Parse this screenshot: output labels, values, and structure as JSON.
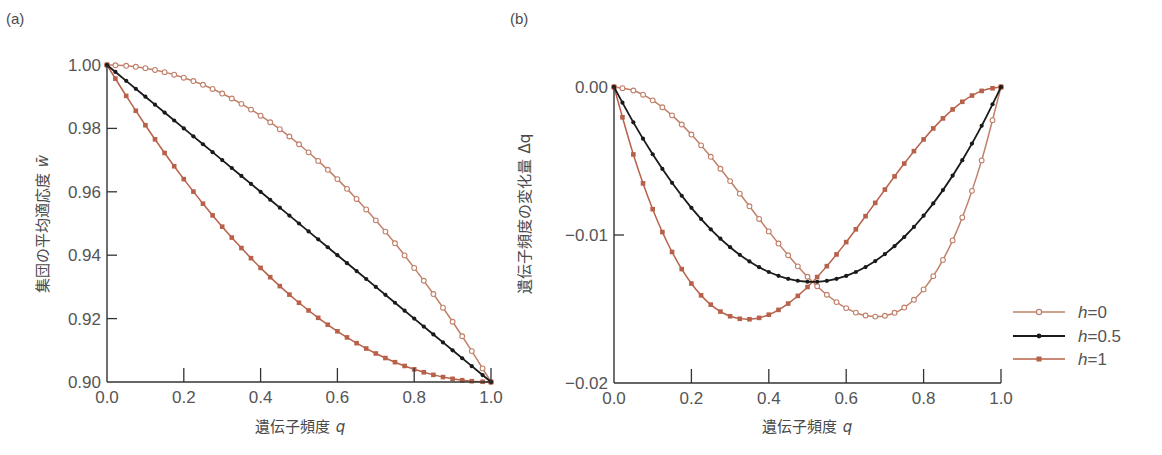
{
  "colors": {
    "h0": "#c0806a",
    "h05": "#1a1a1a",
    "h1": "#b8614a",
    "axis": "#333333",
    "text": "#555555"
  },
  "legend": {
    "items": [
      {
        "key": "h0",
        "prefix": "h",
        "label": "=0",
        "marker": "open-circle"
      },
      {
        "key": "h05",
        "prefix": "h",
        "label": "=0.5",
        "marker": "filled-dot"
      },
      {
        "key": "h1",
        "prefix": "h",
        "label": "=1",
        "marker": "filled-square"
      }
    ]
  },
  "chart_data": [
    {
      "panel": "(a)",
      "type": "line",
      "title": "",
      "xlabel": "遺伝子頻度 q",
      "xlabel_text": "遺伝子頻度",
      "xlabel_var": "q",
      "ylabel": "集団の平均適応度 w̄",
      "ylabel_text": "集団の平均適応度",
      "ylabel_var": "w̄",
      "xlim": [
        0,
        1
      ],
      "ylim": [
        0.9,
        1.0
      ],
      "xticks": [
        "0.0",
        "0.2",
        "0.4",
        "0.6",
        "0.8",
        "1.0"
      ],
      "yticks": [
        "0.90",
        "0.92",
        "0.94",
        "0.96",
        "0.98",
        "1.00"
      ],
      "grid": false,
      "x": [
        0,
        0.05,
        0.1,
        0.15,
        0.2,
        0.25,
        0.3,
        0.35,
        0.4,
        0.45,
        0.5,
        0.55,
        0.6,
        0.65,
        0.7,
        0.75,
        0.8,
        0.85,
        0.9,
        0.95,
        1.0
      ],
      "series": [
        {
          "name": "h=0",
          "key": "h0",
          "values": [
            1,
            0.99975,
            0.999,
            0.99775,
            0.996,
            0.99375,
            0.991,
            0.98775,
            0.984,
            0.97975,
            0.975,
            0.96975,
            0.964,
            0.95775,
            0.951,
            0.94375,
            0.936,
            0.92775,
            0.919,
            0.90975,
            0.9
          ]
        },
        {
          "name": "h=0.5",
          "key": "h05",
          "values": [
            1,
            0.995,
            0.99,
            0.985,
            0.98,
            0.975,
            0.97,
            0.965,
            0.96,
            0.955,
            0.95,
            0.945,
            0.94,
            0.935,
            0.93,
            0.925,
            0.92,
            0.915,
            0.91,
            0.905,
            0.9
          ]
        },
        {
          "name": "h=1",
          "key": "h1",
          "values": [
            1,
            0.99025,
            0.981,
            0.97225,
            0.964,
            0.95625,
            0.949,
            0.94225,
            0.936,
            0.93025,
            0.925,
            0.92025,
            0.916,
            0.91225,
            0.909,
            0.90625,
            0.904,
            0.90225,
            0.901,
            0.90025,
            0.9
          ]
        }
      ]
    },
    {
      "panel": "(b)",
      "type": "line",
      "title": "",
      "xlabel": "遺伝子頻度 q",
      "xlabel_text": "遺伝子頻度",
      "xlabel_var": "q",
      "ylabel": "遺伝子頻度の変化量 Δq",
      "ylabel_text": "遺伝子頻度の変化量",
      "ylabel_var": "Δq",
      "xlim": [
        0,
        1
      ],
      "ylim": [
        -0.02,
        0.0
      ],
      "xticks": [
        "0.0",
        "0.2",
        "0.4",
        "0.6",
        "0.8",
        "1.0"
      ],
      "yticks": [
        "−0.02",
        "−0.01",
        "0.00"
      ],
      "grid": false,
      "legend_position": "right",
      "x": [
        0,
        0.05,
        0.1,
        0.15,
        0.2,
        0.25,
        0.3,
        0.35,
        0.4,
        0.45,
        0.5,
        0.55,
        0.6,
        0.65,
        0.7,
        0.75,
        0.8,
        0.85,
        0.9,
        0.95,
        1.0
      ],
      "series": [
        {
          "name": "h=0",
          "key": "h0",
          "values": [
            0,
            -0.000238,
            -0.000901,
            -0.001917,
            -0.003213,
            -0.004717,
            -0.006357,
            -0.008061,
            -0.009756,
            -0.011368,
            -0.012821,
            -0.014037,
            -0.014938,
            -0.01544,
            -0.015457,
            -0.014901,
            -0.013675,
            -0.011682,
            -0.008814,
            -0.00496,
            0
          ]
        },
        {
          "name": "h=0.5",
          "key": "h05",
          "values": [
            0,
            -0.002387,
            -0.004545,
            -0.006472,
            -0.008163,
            -0.009615,
            -0.010825,
            -0.011788,
            -0.0125,
            -0.012958,
            -0.013158,
            -0.013095,
            -0.012766,
            -0.012166,
            -0.01129,
            -0.010135,
            -0.008696,
            -0.006967,
            -0.004945,
            -0.002624,
            0
          ]
        },
        {
          "name": "h=1",
          "key": "h1",
          "values": [
            0,
            -0.004557,
            -0.008257,
            -0.011147,
            -0.013278,
            -0.014706,
            -0.01549,
            -0.015694,
            -0.015385,
            -0.014633,
            -0.013514,
            -0.012103,
            -0.01048,
            -0.008728,
            -0.006931,
            -0.005172,
            -0.00354,
            -0.00212,
            -0.000999,
            -0.000264,
            0
          ]
        }
      ]
    }
  ]
}
